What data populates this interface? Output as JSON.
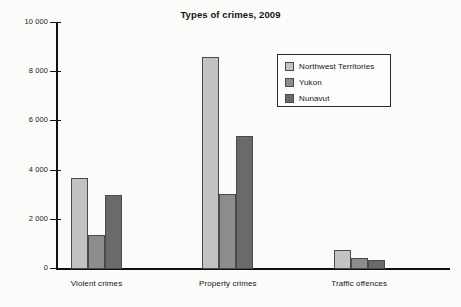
{
  "chart_data": {
    "type": "bar",
    "title": "Types of crimes, 2009",
    "xlabel": "",
    "ylabel": "",
    "categories": [
      "Violent crimes",
      "Property crimes",
      "Traffic offences"
    ],
    "series": [
      {
        "name": "Northwest Territories",
        "color": "#c2c2c2",
        "values": [
          3700,
          8600,
          780
        ]
      },
      {
        "name": "Yukon",
        "color": "#8c8c8c",
        "values": [
          1400,
          3050,
          430
        ]
      },
      {
        "name": "Nunavut",
        "color": "#6a6a6a",
        "values": [
          3000,
          5400,
          350
        ]
      }
    ],
    "ylim": [
      0,
      10000
    ],
    "ytick_values": [
      0,
      2000,
      4000,
      6000,
      8000,
      10000
    ],
    "ytick_labels": [
      "0",
      "2 000",
      "4 000",
      "6 000",
      "8 000",
      "10 000"
    ],
    "grid": false,
    "legend_position": "upper right"
  }
}
